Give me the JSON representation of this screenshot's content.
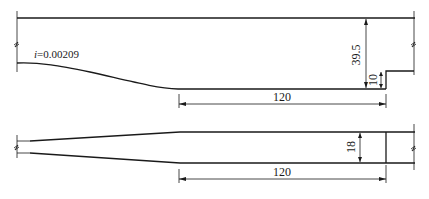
{
  "diagram": {
    "type": "hydraulic-structure-drawing",
    "profile_view": {
      "slope_label_var": "i",
      "slope_label_value": "=0.00209",
      "dimensions": {
        "depth": "39.5",
        "step_height": "10",
        "length": "120"
      }
    },
    "plan_view": {
      "dimensions": {
        "width": "18",
        "length": "120"
      }
    }
  }
}
